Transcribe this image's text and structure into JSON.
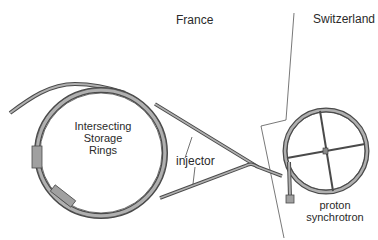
{
  "diagram": {
    "labels": {
      "country_left": "France",
      "country_right": "Switzerland",
      "isr_line1": "Intersecting",
      "isr_line2": "Storage",
      "isr_line3": "Rings",
      "injector": "injector",
      "ps_line1": "proton",
      "ps_line2": "synchrotron"
    },
    "colors": {
      "beamline_fill": "#a8a8a8",
      "beamline_stroke": "#4a4a4a",
      "border_line": "#444444",
      "text": "#2a2a2a"
    }
  }
}
